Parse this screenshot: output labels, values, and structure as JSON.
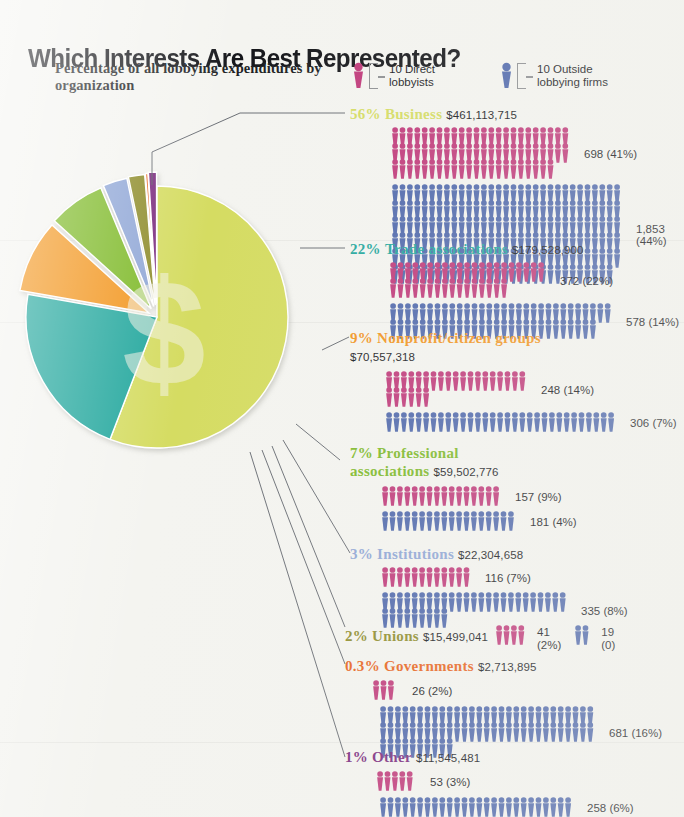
{
  "title": "Which Interests Are Best Represented?",
  "subtitle": "Percentage of all lobbying expenditures by organization",
  "legend": {
    "direct": {
      "label": "10 Direct\nlobbyists",
      "icon": "person-icon",
      "color": "#C0397A"
    },
    "outside": {
      "label": "10 Outside\nlobbying firms",
      "icon": "person-icon",
      "color": "#4F68AC"
    }
  },
  "palette": {
    "business": "#D5DC62",
    "trade": "#22A79D",
    "nonprofit": "#F2951E",
    "professional": "#7DB928",
    "institutions": "#8FA6D6",
    "unions": "#8E8C2C",
    "governments": "#E8631B",
    "other": "#7A2A7E",
    "pink": "#C0397A",
    "blue": "#4F68AC",
    "leader": "#5b6068"
  },
  "chart_data": {
    "type": "pie",
    "title": "Which Interests Are Best Represented?",
    "subtitle": "Percentage of all lobbying expenditures by organization",
    "legend_position": "top-right",
    "categories": [
      "Business",
      "Trade associations",
      "Nonprofit/citizen groups",
      "Professional associations",
      "Institutions",
      "Unions",
      "Governments",
      "Other"
    ],
    "values": [
      56,
      22,
      9,
      7,
      3,
      2,
      0.3,
      1
    ],
    "expenditures": [
      461113715,
      179528900,
      70557318,
      59502776,
      22304658,
      15499041,
      2713895,
      11545481
    ],
    "direct_lobbyists": [
      698,
      372,
      248,
      157,
      116,
      41,
      26,
      53
    ],
    "direct_lobbyists_pct": [
      41,
      22,
      14,
      9,
      7,
      2,
      2,
      3
    ],
    "outside_firms": [
      1853,
      578,
      306,
      181,
      335,
      19,
      681,
      258
    ],
    "outside_firms_pct": [
      44,
      14,
      7,
      4,
      8,
      0,
      16,
      6
    ],
    "unit": "each figure = 10 lobbyists / firms"
  },
  "rows": [
    {
      "id": "business",
      "pct": "56%",
      "name": "Business",
      "amount": "$461,113,715",
      "color": "#D5DC62",
      "direct": {
        "count": 698,
        "label": "698 (41%)"
      },
      "outside": {
        "count": 1853,
        "label": "1,853 (44%)"
      }
    },
    {
      "id": "trade",
      "pct": "22%",
      "name": "Trade associations",
      "amount": "$179,528,900",
      "color": "#22A79D",
      "direct": {
        "count": 372,
        "label": "372 (22%)"
      },
      "outside": {
        "count": 578,
        "label": "578 (14%)"
      }
    },
    {
      "id": "nonprofit",
      "pct": "9%",
      "name": "Nonprofit/citizen groups",
      "amount": "$70,557,318",
      "color": "#F2951E",
      "direct": {
        "count": 248,
        "label": "248 (14%)"
      },
      "outside": {
        "count": 306,
        "label": "306 (7%)"
      }
    },
    {
      "id": "professional",
      "pct": "7%",
      "name": "Professional associations",
      "amount": "$59,502,776",
      "color": "#7DB928",
      "direct": {
        "count": 157,
        "label": "157 (9%)"
      },
      "outside": {
        "count": 181,
        "label": "181 (4%)"
      }
    },
    {
      "id": "institutions",
      "pct": "3%",
      "name": "Institutions",
      "amount": "$22,304,658",
      "color": "#8FA6D6",
      "direct": {
        "count": 116,
        "label": "116 (7%)"
      },
      "outside": {
        "count": 335,
        "label": "335 (8%)"
      }
    },
    {
      "id": "unions",
      "pct": "2%",
      "name": "Unions",
      "amount": "$15,499,041",
      "color": "#8E8C2C",
      "direct": {
        "count": 41,
        "label": "41\n(2%)"
      },
      "outside": {
        "count": 19,
        "label": "19\n(0)"
      }
    },
    {
      "id": "governments",
      "pct": "0.3%",
      "name": "Governments",
      "amount": "$2,713,895",
      "color": "#E8631B",
      "direct": {
        "count": 26,
        "label": "26 (2%)"
      },
      "outside": {
        "count": 681,
        "label": "681 (16%)"
      }
    },
    {
      "id": "other",
      "pct": "1%",
      "name": "Other",
      "amount": "$11,545,481",
      "color": "#7A2A7E",
      "direct": {
        "count": 53,
        "label": "53 (3%)"
      },
      "outside": {
        "count": 258,
        "label": "258 (6%)"
      }
    }
  ]
}
